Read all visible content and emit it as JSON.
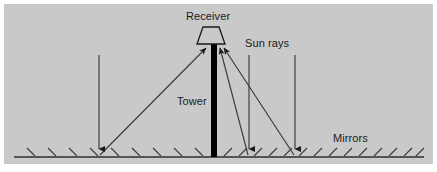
{
  "figure": {
    "background_color": "#c9c9c9",
    "page_color": "#ffffff",
    "ink_color": "#1a1a1a",
    "tower_color": "#000000",
    "labels": {
      "receiver": "Receiver",
      "sun_rays": "Sun rays",
      "tower": "Tower",
      "mirrors": "Mirrors"
    },
    "icons": {
      "receiver": "trapezoid-receiver-icon",
      "tower": "tower-icon",
      "ground": "ground-line-icon",
      "mirror_hatch": "mirror-hatch-icon",
      "sun_ray_arrow": "down-arrow-icon",
      "reflected_ray_arrow": "up-arrow-icon"
    },
    "geometry": {
      "panel": {
        "x": 4,
        "y": 4,
        "width": 429,
        "height": 160
      },
      "ground_line": {
        "x1": 14,
        "y1": 157,
        "x2": 424,
        "y2": 157
      },
      "tower": {
        "x": 211,
        "y_top": 44,
        "y_bottom": 157,
        "width": 6
      },
      "receiver": {
        "top_left_x": 203,
        "top_right_x": 219,
        "top_y": 27,
        "bottom_left_x": 198,
        "bottom_right_x": 224,
        "bottom_y": 44
      },
      "sun_rays": [
        {
          "name": "sun-ray-left",
          "x": 99,
          "y_start": 55,
          "y_end": 155
        },
        {
          "name": "sun-ray-middle",
          "x": 249,
          "y_start": 55,
          "y_end": 155
        },
        {
          "name": "sun-ray-right",
          "x": 295,
          "y_start": 55,
          "y_end": 155
        }
      ],
      "reflected_rays": [
        {
          "name": "reflected-ray-left",
          "x1": 100,
          "y1": 155,
          "x2": 206,
          "y2": 46
        },
        {
          "name": "reflected-ray-middle",
          "x1": 248,
          "y1": 155,
          "x2": 219,
          "y2": 46
        },
        {
          "name": "reflected-ray-right",
          "x1": 294,
          "y1": 155,
          "x2": 222,
          "y2": 46
        }
      ],
      "mirror_hatch": {
        "count_left": 9,
        "count_right": 14,
        "tilt_left": "down-right",
        "tilt_right": "up-right",
        "length": 11
      }
    }
  }
}
